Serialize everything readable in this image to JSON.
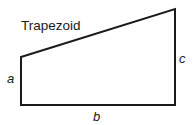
{
  "diagram": {
    "title": "Trapezoid",
    "shape": "right trapezoid",
    "labels": {
      "left_side": "a",
      "bottom_side": "b",
      "right_side": "c"
    },
    "stroke_color": "#1a1a1a",
    "background_color": "#ffffff"
  }
}
